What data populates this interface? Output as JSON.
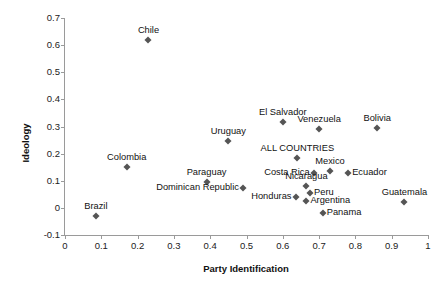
{
  "chart_data": {
    "type": "scatter",
    "title": "",
    "xlabel": "Party Identification",
    "ylabel": "Ideology",
    "xlim": [
      0,
      1
    ],
    "ylim": [
      -0.1,
      0.7
    ],
    "xticks": [
      "0",
      "0.1",
      "0.2",
      "0.3",
      "0.4",
      "0.5",
      "0.6",
      "0.7",
      "0.8",
      "0.9",
      "1"
    ],
    "yticks": [
      "0.7",
      "0.6",
      "0.5",
      "0.4",
      "0.3",
      "0.2",
      "0.1",
      "0",
      "-0.1"
    ],
    "grid": false,
    "legend": "none",
    "marker_color": "#555555",
    "points": [
      {
        "label": "Chile",
        "x": 0.23,
        "y": 0.62,
        "label_pos": "above"
      },
      {
        "label": "El Salvador",
        "x": 0.6,
        "y": 0.315,
        "label_pos": "above"
      },
      {
        "label": "Venezuela",
        "x": 0.7,
        "y": 0.29,
        "label_pos": "above"
      },
      {
        "label": "Bolivia",
        "x": 0.86,
        "y": 0.295,
        "label_pos": "above"
      },
      {
        "label": "Uruguay",
        "x": 0.45,
        "y": 0.245,
        "label_pos": "above"
      },
      {
        "label": "ALL COUNTRIES",
        "x": 0.64,
        "y": 0.185,
        "label_pos": "above"
      },
      {
        "label": "Mexico",
        "x": 0.73,
        "y": 0.135,
        "label_pos": "above"
      },
      {
        "label": "Colombia",
        "x": 0.17,
        "y": 0.15,
        "label_pos": "above"
      },
      {
        "label": "Paraguay",
        "x": 0.39,
        "y": 0.095,
        "label_pos": "above"
      },
      {
        "label": "Costa Rica",
        "x": 0.685,
        "y": 0.13,
        "label_pos": "left"
      },
      {
        "label": "Ecuador",
        "x": 0.78,
        "y": 0.13,
        "label_pos": "right"
      },
      {
        "label": "Dominican Republic",
        "x": 0.49,
        "y": 0.075,
        "label_pos": "left"
      },
      {
        "label": "Nicaragua",
        "x": 0.665,
        "y": 0.08,
        "label_pos": "above"
      },
      {
        "label": "Honduras",
        "x": 0.635,
        "y": 0.04,
        "label_pos": "left"
      },
      {
        "label": "Peru",
        "x": 0.675,
        "y": 0.055,
        "label_pos": "right"
      },
      {
        "label": "Argentina",
        "x": 0.665,
        "y": 0.025,
        "label_pos": "right"
      },
      {
        "label": "Panama",
        "x": 0.71,
        "y": -0.02,
        "label_pos": "right"
      },
      {
        "label": "Guatemala",
        "x": 0.935,
        "y": 0.02,
        "label_pos": "above"
      },
      {
        "label": "Brazil",
        "x": 0.085,
        "y": -0.03,
        "label_pos": "above"
      }
    ]
  }
}
